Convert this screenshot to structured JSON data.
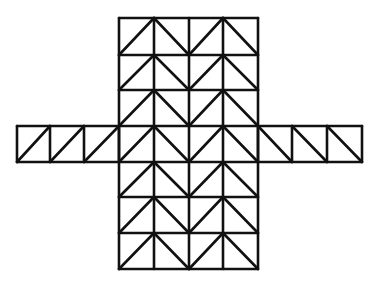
{
  "figure": {
    "stroke_color": "#111111",
    "background": "#ffffff",
    "center_block": {
      "columns_x": [
        119,
        154,
        189,
        223,
        258
      ],
      "rows_y": [
        18,
        55,
        90,
        126,
        162,
        197,
        233,
        269
      ],
      "diagonal_pattern": [
        "/",
        "\\",
        "/",
        "\\"
      ]
    },
    "left_arm": {
      "columns_x": [
        17,
        50,
        84,
        119
      ],
      "rows_y": [
        126,
        162
      ],
      "diagonal": "/"
    },
    "right_arm": {
      "columns_x": [
        258,
        292,
        327,
        362
      ],
      "rows_y": [
        126,
        162
      ],
      "diagonal": "\\"
    }
  }
}
